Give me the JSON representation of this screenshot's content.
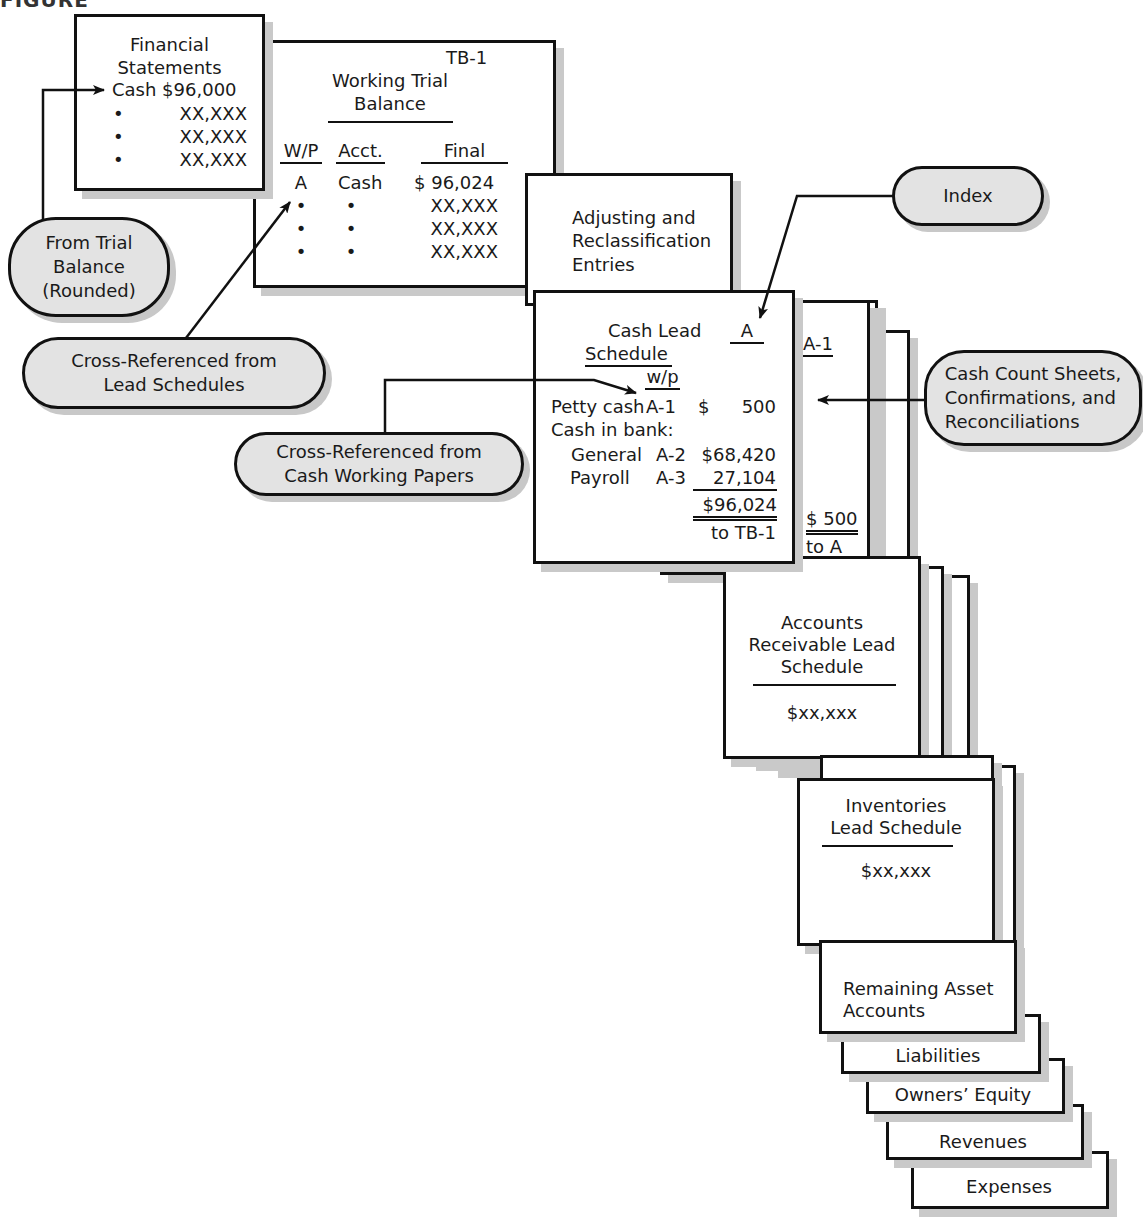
{
  "figure_caption": "FIGURE",
  "financial_statements": {
    "title_line1": "Financial",
    "title_line2": "Statements",
    "cash_line": "Cash $96,000",
    "bullet": "•",
    "rows": [
      "XX,XXX",
      "XX,XXX",
      "XX,XXX"
    ]
  },
  "working_trial_balance": {
    "ref": "TB-1",
    "title_line1": "Working Trial",
    "title_line2": "Balance",
    "columns": [
      "W/P",
      "Acct.",
      "Final"
    ],
    "first_row": {
      "wp": "A",
      "acct": "Cash",
      "final": "$ 96,024"
    },
    "bullet": "•",
    "other_rows": [
      "XX,XXX",
      "XX,XXX",
      "XX,XXX"
    ]
  },
  "adjusting_entries": {
    "line1": "Adjusting and",
    "line2": "Reclassification",
    "line3": "Entries"
  },
  "cash_lead_schedule": {
    "title_line1": "Cash Lead",
    "title_line2": "Schedule",
    "index": "A",
    "wp_header": "w/p",
    "petty_cash": {
      "label": "Petty cash",
      "wp": "A-1",
      "currency": "$",
      "amount": "500"
    },
    "cash_in_bank_label": "Cash in bank:",
    "general": {
      "label": "General",
      "wp": "A-2",
      "amount": "$68,420"
    },
    "payroll": {
      "label": "Payroll",
      "wp": "A-3",
      "amount": "27,104"
    },
    "total": "$96,024",
    "to_ref": "to TB-1"
  },
  "petty_cash_paper": {
    "index": "A-1",
    "amount": "$ 500",
    "to_ref": "to A"
  },
  "ar_lead_schedule": {
    "line1": "Accounts",
    "line2": "Receivable Lead",
    "line3": "Schedule",
    "amount": "$xx,xxx"
  },
  "inventories_lead_schedule": {
    "line1": "Inventories",
    "line2": "Lead Schedule",
    "amount": "$xx,xxx"
  },
  "remaining_tabs": [
    {
      "label_line1": "Remaining Asset",
      "label_line2": "Accounts"
    },
    {
      "label_line1": "Liabilities"
    },
    {
      "label_line1": "Owners’ Equity"
    },
    {
      "label_line1": "Revenues"
    },
    {
      "label_line1": "Expenses"
    }
  ],
  "callouts": {
    "from_trial_balance": {
      "line1": "From Trial",
      "line2": "Balance",
      "line3": "(Rounded)"
    },
    "cross_ref_lead": {
      "line1": "Cross-Referenced from",
      "line2": "Lead Schedules"
    },
    "cross_ref_cash": {
      "line1": "Cross-Referenced from",
      "line2": "Cash Working Papers"
    },
    "index": {
      "line1": "Index"
    },
    "cash_count": {
      "line1": "Cash Count Sheets,",
      "line2": "Confirmations, and",
      "line3": "Reconciliations"
    }
  },
  "colors": {
    "bubble_fill": "#e3e3e3",
    "line": "#111111",
    "shadow": "#c9c9c9"
  }
}
